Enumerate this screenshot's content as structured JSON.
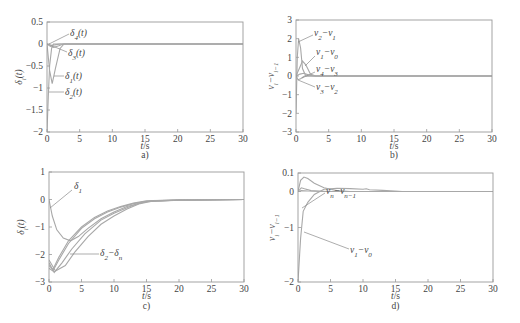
{
  "chart_data": [
    {
      "id": "a",
      "type": "line",
      "caption": "a)",
      "xlabel": "t/s",
      "ylabel": "δ_i(t)",
      "xlim": [
        0,
        30
      ],
      "ylim": [
        -2,
        0.5
      ],
      "xticks": [
        0,
        5,
        10,
        15,
        20,
        25,
        30
      ],
      "yticks": [
        -2,
        -1.5,
        -1,
        -0.5,
        0,
        0.5
      ],
      "ytick_labels": [
        "−2",
        "−1.5",
        "−1",
        "−0.5",
        "0",
        "0.5"
      ],
      "grid": false,
      "series": [
        {
          "name": "δ1(t)",
          "points": [
            [
              0,
              0
            ],
            [
              0.4,
              -0.6
            ],
            [
              0.8,
              -0.9
            ],
            [
              1.3,
              -0.55
            ],
            [
              2.0,
              -0.1
            ],
            [
              2.6,
              0
            ],
            [
              30,
              0
            ]
          ]
        },
        {
          "name": "δ2(t)",
          "points": [
            [
              0,
              -2
            ],
            [
              0.2,
              -1.2
            ],
            [
              0.4,
              -0.5
            ],
            [
              0.7,
              -0.1
            ],
            [
              1.0,
              0
            ],
            [
              30,
              0
            ]
          ]
        },
        {
          "name": "δ3(t)",
          "points": [
            [
              0,
              0
            ],
            [
              0.5,
              -0.05
            ],
            [
              1.0,
              -0.08
            ],
            [
              1.8,
              -0.04
            ],
            [
              2.5,
              0
            ],
            [
              30,
              0
            ]
          ]
        },
        {
          "name": "δ4(t)",
          "points": [
            [
              0,
              0
            ],
            [
              0.6,
              -0.03
            ],
            [
              1.2,
              -0.02
            ],
            [
              2.0,
              0
            ],
            [
              30,
              0
            ]
          ]
        }
      ],
      "annotations": [
        {
          "text": "δ4(t)",
          "label_base": "δ",
          "label_sub": "4",
          "label_suffix": "(t)",
          "tx": 70,
          "ty": 36,
          "lx1": 69,
          "ly1": 34,
          "lx2": 49,
          "ly2": 44
        },
        {
          "text": "δ3(t)",
          "label_base": "δ",
          "label_sub": "3",
          "label_suffix": "(t)",
          "tx": 68,
          "ty": 56,
          "lx1": 67,
          "ly1": 52,
          "lx2": 50,
          "ly2": 45
        },
        {
          "text": "δ1(t)",
          "label_base": "δ",
          "label_sub": "1",
          "label_suffix": "(t)",
          "tx": 65,
          "ty": 79,
          "lx1": 64,
          "ly1": 76,
          "lx2": 54,
          "ly2": 76
        },
        {
          "text": "δ2(t)",
          "label_base": "δ",
          "label_sub": "2",
          "label_suffix": "(t)",
          "tx": 65,
          "ty": 95,
          "lx1": 64,
          "ly1": 92,
          "lx2": 49,
          "ly2": 92
        }
      ]
    },
    {
      "id": "b",
      "type": "line",
      "caption": "b)",
      "xlabel": "t/s",
      "ylabel": "v_i−v_{i−1}",
      "xlim": [
        0,
        30
      ],
      "ylim": [
        -3,
        3
      ],
      "xticks": [
        0,
        5,
        10,
        15,
        20,
        25,
        30
      ],
      "yticks": [
        -3,
        -2,
        -1,
        0,
        1,
        2,
        3
      ],
      "ytick_labels": [
        "−3",
        "−2",
        "−1",
        "0",
        "1",
        "2",
        "3"
      ],
      "grid": false,
      "series": [
        {
          "name": "v2−v1",
          "points": [
            [
              0,
              -2
            ],
            [
              0.2,
              1.0
            ],
            [
              0.4,
              2.0
            ],
            [
              0.7,
              1.5
            ],
            [
              1.0,
              0.4
            ],
            [
              1.5,
              0
            ],
            [
              30,
              0
            ]
          ]
        },
        {
          "name": "v1−v0",
          "points": [
            [
              0,
              0
            ],
            [
              0.5,
              0.4
            ],
            [
              1.0,
              0.8
            ],
            [
              1.5,
              0.6
            ],
            [
              2.2,
              0.1
            ],
            [
              3,
              0
            ],
            [
              30,
              0
            ]
          ]
        },
        {
          "name": "v4−v3",
          "points": [
            [
              0,
              0
            ],
            [
              0.6,
              0.1
            ],
            [
              1.2,
              0.15
            ],
            [
              2,
              0.05
            ],
            [
              2.8,
              0
            ],
            [
              30,
              0
            ]
          ]
        },
        {
          "name": "v3−v2",
          "points": [
            [
              0,
              0
            ],
            [
              0.3,
              -0.2
            ],
            [
              0.7,
              -0.15
            ],
            [
              1.3,
              0
            ],
            [
              30,
              0
            ]
          ]
        }
      ],
      "annotations": [
        {
          "text": "v2−v1",
          "label_base": "v",
          "label_sub": "2",
          "label_mid": "−v",
          "label_sub2": "1",
          "tx": 314,
          "ty": 36,
          "lx1": 313,
          "ly1": 35,
          "lx2": 298,
          "ly2": 42
        },
        {
          "text": "v1−v0",
          "label_base": "v",
          "label_sub": "1",
          "label_mid": "−v",
          "label_sub2": "0",
          "tx": 316,
          "ty": 55,
          "lx1": 315,
          "ly1": 56,
          "lx2": 305,
          "ly2": 66
        },
        {
          "text": "v4−v3",
          "label_base": "v",
          "label_sub": "4",
          "label_mid": "−v",
          "label_sub2": "3",
          "tx": 316,
          "ty": 72,
          "lx1": 315,
          "ly1": 72,
          "lx2": 302,
          "ly2": 78
        },
        {
          "text": "v3−v2",
          "label_base": "v",
          "label_sub": "3",
          "label_mid": "−v",
          "label_sub2": "2",
          "tx": 316,
          "ty": 90,
          "lx1": 315,
          "ly1": 87,
          "lx2": 298,
          "ly2": 80
        }
      ]
    },
    {
      "id": "c",
      "type": "line",
      "caption": "c)",
      "xlabel": "t/s",
      "ylabel": "δ_i(t)",
      "xlim": [
        0,
        30
      ],
      "ylim": [
        -3,
        1
      ],
      "xticks": [
        0,
        5,
        10,
        15,
        20,
        25,
        30
      ],
      "yticks": [
        -3,
        -2,
        -1,
        0,
        1
      ],
      "ytick_labels": [
        "−3",
        "−2",
        "−1",
        "0",
        "1"
      ],
      "grid": false,
      "series": [
        {
          "name": "δ1",
          "points": [
            [
              0,
              0
            ],
            [
              0.5,
              -0.6
            ],
            [
              1.2,
              -1.1
            ],
            [
              2.2,
              -1.4
            ],
            [
              3.3,
              -1.5
            ],
            [
              4.5,
              -1.35
            ],
            [
              6,
              -1.05
            ],
            [
              8,
              -0.7
            ],
            [
              10,
              -0.45
            ],
            [
              12,
              -0.25
            ],
            [
              15,
              -0.08
            ],
            [
              20,
              -0.02
            ],
            [
              30,
              0
            ]
          ]
        },
        {
          "name": "δ2",
          "points": [
            [
              0,
              -2.5
            ],
            [
              0.6,
              -2.6
            ],
            [
              1.5,
              -2.2
            ],
            [
              3,
              -1.6
            ],
            [
              5,
              -1.05
            ],
            [
              7,
              -0.7
            ],
            [
              9,
              -0.45
            ],
            [
              11,
              -0.28
            ],
            [
              13,
              -0.15
            ],
            [
              15,
              -0.06
            ],
            [
              20,
              -0.02
            ],
            [
              30,
              0
            ]
          ]
        },
        {
          "name": "δ3",
          "points": [
            [
              0,
              -2.4
            ],
            [
              0.6,
              -2.55
            ],
            [
              1.5,
              -2.1
            ],
            [
              3,
              -1.5
            ],
            [
              5,
              -1.0
            ],
            [
              7,
              -0.65
            ],
            [
              9,
              -0.42
            ],
            [
              11,
              -0.26
            ],
            [
              13,
              -0.13
            ],
            [
              15,
              -0.05
            ],
            [
              20,
              -0.02
            ],
            [
              30,
              0
            ]
          ]
        },
        {
          "name": "δ4",
          "points": [
            [
              0,
              -2.3
            ],
            [
              0.8,
              -2.65
            ],
            [
              2,
              -2.3
            ],
            [
              3.5,
              -1.8
            ],
            [
              5.5,
              -1.25
            ],
            [
              8,
              -0.75
            ],
            [
              10,
              -0.5
            ],
            [
              12,
              -0.3
            ],
            [
              14,
              -0.12
            ],
            [
              16,
              -0.04
            ],
            [
              20,
              -0.02
            ],
            [
              30,
              0
            ]
          ]
        },
        {
          "name": "δn",
          "points": [
            [
              0,
              -2.2
            ],
            [
              1.0,
              -2.6
            ],
            [
              2.5,
              -2.4
            ],
            [
              4,
              -1.9
            ],
            [
              6,
              -1.35
            ],
            [
              8,
              -0.9
            ],
            [
              10,
              -0.6
            ],
            [
              12,
              -0.35
            ],
            [
              14,
              -0.15
            ],
            [
              16,
              -0.05
            ],
            [
              20,
              -0.02
            ],
            [
              30,
              0
            ]
          ]
        }
      ],
      "annotations": [
        {
          "text": "δ1",
          "label_base": "δ",
          "label_sub": "1",
          "tx": 74,
          "ty": 189,
          "lx1": 72,
          "ly1": 190,
          "lx2": 50,
          "ly2": 208
        },
        {
          "text": "δ2−δn",
          "label_base": "δ",
          "label_sub": "2",
          "label_mid": "−δ",
          "label_sub2": "n",
          "tx": 100,
          "ty": 256,
          "lx1": 99,
          "ly1": 254,
          "lx2": 70,
          "ly2": 254
        }
      ]
    },
    {
      "id": "d",
      "type": "line",
      "caption": "d)",
      "xlabel": "t/s",
      "ylabel": "v_i−v_{i−1}",
      "xlim": [
        0,
        30
      ],
      "ylim": [
        -2,
        0.1
      ],
      "xticks": [
        0,
        5,
        10,
        15,
        20,
        25,
        30
      ],
      "yticks": [
        -2,
        -1,
        0,
        0.1
      ],
      "ytick_labels": [
        "−2",
        "−1",
        "0",
        "0.1"
      ],
      "ytick_pixel_fraction": [
        0,
        0.5,
        0.83,
        1.0
      ],
      "grid": false,
      "note": "non-linear y-axis: upper portion (0 to 0.1) is expanded",
      "series": [
        {
          "name": "v1−v0",
          "points": [
            [
              0,
              -2
            ],
            [
              0.4,
              -1.2
            ],
            [
              0.8,
              -0.55
            ],
            [
              1.5,
              -0.3
            ],
            [
              2.5,
              -0.08
            ],
            [
              4,
              0.012
            ],
            [
              6,
              0.018
            ],
            [
              8,
              0.016
            ],
            [
              10,
              0.012
            ],
            [
              10.5,
              0.015
            ],
            [
              11,
              0.01
            ],
            [
              13,
              0.006
            ],
            [
              15.5,
              0.002
            ],
            [
              16,
              0
            ],
            [
              30,
              0
            ]
          ]
        },
        {
          "name": "v2−v1",
          "points": [
            [
              0,
              0
            ],
            [
              0.4,
              0.06
            ],
            [
              0.9,
              0.078
            ],
            [
              1.5,
              0.07
            ],
            [
              2.5,
              0.045
            ],
            [
              4,
              0.02
            ],
            [
              6,
              0.005
            ],
            [
              8,
              0
            ],
            [
              30,
              0
            ]
          ]
        },
        {
          "name": "v3−v2",
          "points": [
            [
              0,
              0
            ],
            [
              0.5,
              0.02
            ],
            [
              1,
              0.015
            ],
            [
              2,
              0.005
            ],
            [
              4,
              0
            ],
            [
              30,
              0
            ]
          ]
        },
        {
          "name": "vn−vn−1",
          "points": [
            [
              0,
              0
            ],
            [
              0.5,
              0.005
            ],
            [
              1.5,
              0.003
            ],
            [
              3,
              0.001
            ],
            [
              6,
              0
            ],
            [
              30,
              0
            ]
          ]
        }
      ],
      "annotations": [
        {
          "text": "vn−vn−1",
          "label_base": "v",
          "label_sub": "n",
          "label_mid": "−v",
          "label_sub2": "n−1",
          "tx": 326,
          "ty": 194,
          "lx1": 325,
          "ly1": 193,
          "lx2": 302,
          "ly2": 208
        },
        {
          "text": "v1−v0",
          "label_base": "v",
          "label_sub": "1",
          "label_mid": "−v",
          "label_sub2": "0",
          "tx": 350,
          "ty": 253,
          "lx1": 349,
          "ly1": 249,
          "lx2": 304,
          "ly2": 232
        }
      ]
    }
  ],
  "panels": [
    {
      "id": "a",
      "frame": {
        "x0": 47,
        "x1": 243,
        "y0": 22,
        "y1": 132
      },
      "ylabel_x": 14,
      "caption_y": 158,
      "xlabel_y": 149
    },
    {
      "id": "b",
      "frame": {
        "x0": 296,
        "x1": 492,
        "y0": 20,
        "y1": 132
      },
      "ylabel_x": 266,
      "caption_y": 158,
      "xlabel_y": 149
    },
    {
      "id": "c",
      "frame": {
        "x0": 49,
        "x1": 244,
        "y0": 172,
        "y1": 282
      },
      "ylabel_x": 16,
      "caption_y": 309,
      "xlabel_y": 299
    },
    {
      "id": "d",
      "frame": {
        "x0": 298,
        "x1": 493,
        "y0": 173,
        "y1": 282
      },
      "ylabel_x": 267,
      "caption_y": 309,
      "xlabel_y": 299
    }
  ]
}
